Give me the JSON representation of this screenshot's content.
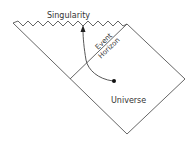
{
  "diagram": {
    "type": "penrose-diagram",
    "labels": {
      "singularity": "Singularity",
      "event": "Event",
      "horizon": "Horizon",
      "universe": "Universe"
    },
    "colors": {
      "line": "#555555",
      "text": "#333333",
      "background": "#ffffff"
    }
  }
}
